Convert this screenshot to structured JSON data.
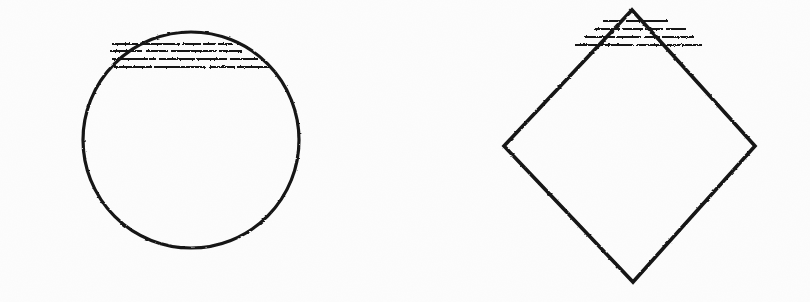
{
  "sheet": {
    "width": 810,
    "height": 302,
    "background_color": "#fdfdfd",
    "ink_color": "#141414",
    "style": "scanned hand-inked engineering sketch, photocopy grain",
    "caption": ""
  },
  "figures": [
    {
      "id": "circle-figure",
      "name": "Circular cross-section with hatched upper segment",
      "shape_type": "circle",
      "center_x": 191,
      "center_y": 140,
      "radius": 108,
      "outline_width": 3.2,
      "centerline": {
        "type": "dash-dot",
        "y": 146,
        "x_start": 33,
        "x_end": 350,
        "pattern": "long-dash short-dash long-dash short-dash long-dash",
        "width": 2.4,
        "segments": [
          {
            "x1": 33,
            "x2": 130
          },
          {
            "x1": 143,
            "x2": 155
          },
          {
            "x1": 168,
            "x2": 252
          },
          {
            "x1": 264,
            "x2": 276
          },
          {
            "x1": 289,
            "x2": 350
          }
        ]
      },
      "hatch": {
        "count": 4,
        "orientation": "horizontal",
        "width": 2.2,
        "overshoot_left": 12,
        "overshoot_right": 10,
        "lines": [
          {
            "y": 44,
            "x1": 112,
            "x2": 252
          },
          {
            "y": 51,
            "x1": 110,
            "x2": 268
          },
          {
            "y": 59,
            "x1": 112,
            "x2": 274
          },
          {
            "y": 67,
            "x1": 114,
            "x2": 276
          }
        ]
      }
    },
    {
      "id": "diamond-figure",
      "name": "Rhombic cross-section with hatched upper apex",
      "shape_type": "diamond",
      "vertices": [
        {
          "label": "top",
          "x": 632,
          "y": 10
        },
        {
          "label": "right",
          "x": 755,
          "y": 146
        },
        {
          "label": "bottom",
          "x": 633,
          "y": 282
        },
        {
          "label": "left",
          "x": 504,
          "y": 146
        }
      ],
      "outline_width": 3.6,
      "centerline": {
        "type": "dash-dot",
        "y": 146,
        "x_start": 478,
        "x_end": 788,
        "pattern": "long-dash short-dash long-dash short-dash long-dash",
        "width": 2.4,
        "segments": [
          {
            "x1": 478,
            "x2": 572
          },
          {
            "x1": 583,
            "x2": 596
          },
          {
            "x1": 612,
            "x2": 690
          },
          {
            "x1": 702,
            "x2": 716
          },
          {
            "x1": 728,
            "x2": 788
          }
        ]
      },
      "hatch": {
        "count": 4,
        "orientation": "horizontal",
        "width": 2.2,
        "overshoot_left": 14,
        "overshoot_right": 14,
        "lines": [
          {
            "y": 21,
            "x1": 603,
            "x2": 674
          },
          {
            "y": 29,
            "x1": 594,
            "x2": 686
          },
          {
            "y": 37,
            "x1": 585,
            "x2": 694
          },
          {
            "y": 45,
            "x1": 575,
            "x2": 702
          }
        ]
      }
    }
  ],
  "labels": {
    "figure_left": "",
    "figure_right": "",
    "annotations": []
  }
}
